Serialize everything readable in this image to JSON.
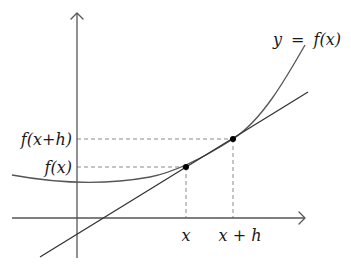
{
  "diagram": {
    "curve_label": "y = f(x)",
    "curve_label_parts": {
      "lhs": "y",
      "eq": "=",
      "rhs": "f(x)"
    },
    "y_labels": {
      "fxh": "f(x+h)",
      "fx": "f(x)"
    },
    "x_labels": {
      "x": "x",
      "xh": "x + h"
    },
    "points": [
      {
        "name": "point-x",
        "label": "(x, f(x))",
        "px": 186,
        "py": 167
      },
      {
        "name": "point-x-plus-h",
        "label": "(x+h, f(x+h))",
        "px": 233,
        "py": 139
      }
    ],
    "colors": {
      "axis": "#555555",
      "curve": "#555555",
      "secant": "#333333",
      "dashed": "#888888",
      "point": "#000000",
      "text": "#1a1a1a"
    }
  }
}
